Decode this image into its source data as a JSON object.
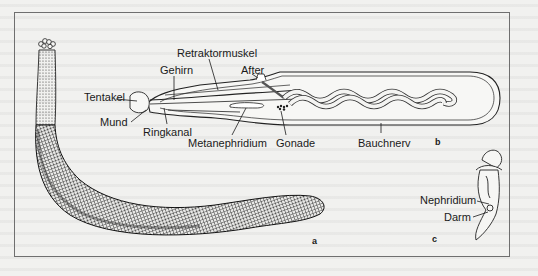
{
  "figure": {
    "panels": [
      {
        "id": "a",
        "label": "a"
      },
      {
        "id": "b",
        "label": "b"
      },
      {
        "id": "c",
        "label": "c"
      }
    ],
    "labels_b": {
      "retraktormuskel": "Retraktormuskel",
      "gehirn": "Gehirn",
      "after": "After",
      "tentakel": "Tentakel",
      "mund": "Mund",
      "ringkanal": "Ringkanal",
      "metanephridium": "Metanephridium",
      "gonade": "Gonade",
      "bauchnerv": "Bauchnerv"
    },
    "labels_c": {
      "nephridium": "Nephridium",
      "darm": "Darm"
    },
    "colors": {
      "ink": "#1a1a1a",
      "paper": "#f1f1ef",
      "frame": "#6f6f6f"
    }
  }
}
